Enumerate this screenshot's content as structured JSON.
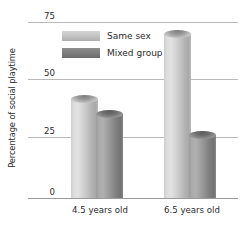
{
  "chart_data": {
    "type": "bar",
    "title": "",
    "xlabel": "",
    "ylabel": "Percentage of social playtime",
    "categories": [
      "4.5 years old",
      "6.5 years old"
    ],
    "series": [
      {
        "name": "Same sex",
        "values": [
          42,
          70
        ]
      },
      {
        "name": "Mixed group",
        "values": [
          36,
          27
        ]
      }
    ],
    "ylim": [
      0,
      75
    ],
    "yticks": [
      0,
      25,
      50,
      75
    ],
    "ytick_labels": [
      "0",
      "25",
      "50",
      "75"
    ],
    "grid": true,
    "legend_position": "top-left-inside",
    "colors": {
      "same_sex": "#cfcfcf",
      "mixed_group": "#8d8d8d",
      "gridline": "#b9b9b9",
      "text": "#2b2b2b",
      "background": "#ffffff"
    }
  }
}
